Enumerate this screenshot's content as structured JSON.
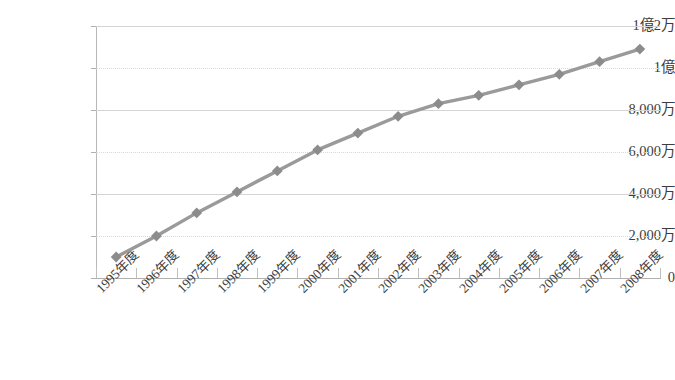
{
  "chart_data": {
    "type": "line",
    "title": "",
    "subtitle": "",
    "xlabel": "",
    "ylabel": "",
    "legend": [],
    "legend_position": "none",
    "grid": true,
    "categories": [
      "1995年度",
      "1996年度",
      "1997年度",
      "1998年度",
      "1999年度",
      "2000年度",
      "2001年度",
      "2002年度",
      "2003年度",
      "2004年度",
      "2005年度",
      "2006年度",
      "2007年度",
      "2008年度"
    ],
    "values": [
      10000000,
      20000000,
      31000000,
      41000000,
      51000000,
      61000000,
      69000000,
      77000000,
      83000000,
      87000000,
      92000000,
      97000000,
      103000000,
      109000000
    ],
    "ylim": [
      0,
      120000000
    ],
    "ytick_values": [
      0,
      20000000,
      40000000,
      60000000,
      80000000,
      100000000,
      120000000
    ],
    "ytick_labels": [
      "0",
      "2,000万",
      "4,000万",
      "6,000万",
      "8,000万",
      "1億",
      "1億2万"
    ],
    "series_name": "",
    "marker": "diamond",
    "line_color": "#9a9a9a",
    "marker_color": "#8c8c8c",
    "grid_color": "#d4d4d4",
    "axis_color": "#b0b0b0",
    "text_color": "#3d3d3d",
    "background_color": "#ffffff"
  }
}
